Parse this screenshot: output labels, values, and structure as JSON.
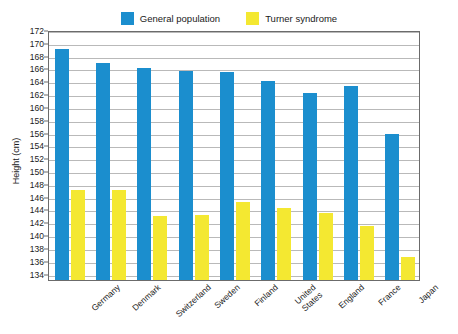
{
  "legend": {
    "entries": [
      {
        "label": "General population",
        "color": "#1b8ece",
        "icon": "legend-swatch-blue"
      },
      {
        "label": "Turner syndrome",
        "color": "#f4e831",
        "icon": "legend-swatch-yellow"
      }
    ]
  },
  "axes": {
    "ylabel": "Height (cm)",
    "yticks": [
      172,
      170,
      168,
      166,
      164,
      162,
      160,
      158,
      156,
      154,
      152,
      150,
      148,
      146,
      144,
      142,
      140,
      138,
      136,
      134
    ]
  },
  "chart_data": {
    "type": "bar",
    "title": "",
    "xlabel": "",
    "ylabel": "Height (cm)",
    "ylim": [
      133,
      172
    ],
    "ytick_step": 2,
    "grid": true,
    "legend_position": "top-center",
    "categories": [
      "Germany",
      "Denmark",
      "Switzerland",
      "Sweden",
      "Finland",
      "United States",
      "England",
      "France",
      "Japan"
    ],
    "series": [
      {
        "name": "General population",
        "color": "#1b8ece",
        "values": [
          169.0,
          166.8,
          166.0,
          165.6,
          165.4,
          164.0,
          162.2,
          163.2,
          155.8
        ]
      },
      {
        "name": "Turner syndrome",
        "color": "#f4e831",
        "values": [
          147.0,
          147.0,
          143.0,
          143.1,
          145.1,
          144.2,
          143.4,
          141.4,
          136.6
        ]
      }
    ]
  }
}
